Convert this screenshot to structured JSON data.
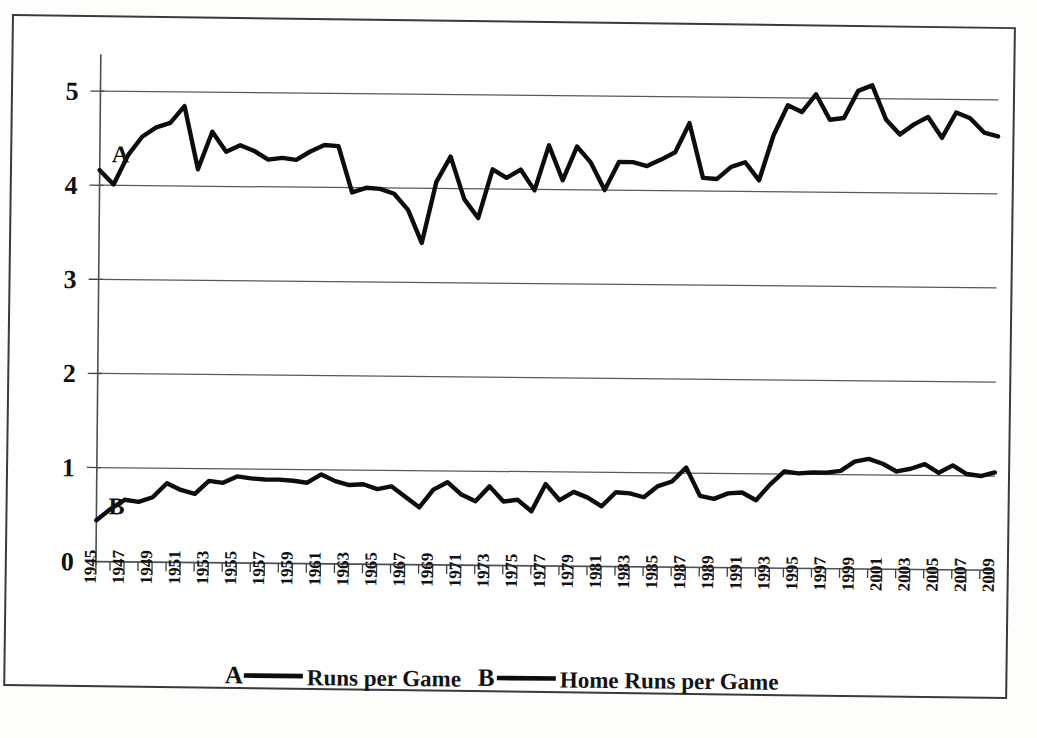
{
  "figure": {
    "name": "baseball-offense-chart",
    "border_color": "#3a3a3a",
    "background": "#ffffff"
  },
  "axes": {
    "y_ticks": [
      "0",
      "1",
      "2",
      "3",
      "4",
      "5"
    ],
    "y_min": 0,
    "y_max": 5.45,
    "x_min": 1945,
    "x_max": 2009,
    "x_tick_labels": [
      "1945",
      "1947",
      "1949",
      "1951",
      "1953",
      "1955",
      "1957",
      "1959",
      "1961",
      "1963",
      "1965",
      "1967",
      "1969",
      "1971",
      "1973",
      "1975",
      "1977",
      "1979",
      "1981",
      "1983",
      "1985",
      "1987",
      "1989",
      "1991",
      "1993",
      "1995",
      "1997",
      "1999",
      "2001",
      "2003",
      "2005",
      "2007",
      "2009"
    ],
    "grid": "horizontal"
  },
  "series_tags": {
    "a": "A",
    "b": "B"
  },
  "legend": {
    "position": "bottom-center",
    "items": [
      {
        "tag": "A",
        "label": "Runs per Game"
      },
      {
        "tag": "B",
        "label": "Home Runs per Game"
      }
    ]
  },
  "colors": {
    "line": "#0d0d0d",
    "grid": "#555a5e",
    "axis": "#4a4f53",
    "text": "#111111"
  },
  "chart_data": {
    "type": "line",
    "title": "",
    "xlabel": "",
    "ylabel": "",
    "xlim": [
      1945,
      2009
    ],
    "ylim": [
      0,
      5.45
    ],
    "grid": true,
    "legend_position": "bottom-center",
    "x": [
      1945,
      1946,
      1947,
      1948,
      1949,
      1950,
      1951,
      1952,
      1953,
      1954,
      1955,
      1956,
      1957,
      1958,
      1959,
      1960,
      1961,
      1962,
      1963,
      1964,
      1965,
      1966,
      1967,
      1968,
      1969,
      1970,
      1971,
      1972,
      1973,
      1974,
      1975,
      1976,
      1977,
      1978,
      1979,
      1980,
      1981,
      1982,
      1983,
      1984,
      1985,
      1986,
      1987,
      1988,
      1989,
      1990,
      1991,
      1992,
      1993,
      1994,
      1995,
      1996,
      1997,
      1998,
      1999,
      2000,
      2001,
      2002,
      2003,
      2004,
      2005,
      2006,
      2007,
      2008,
      2009
    ],
    "series": [
      {
        "name": "Runs per Game",
        "tag": "A",
        "values": [
          4.16,
          4.01,
          4.32,
          4.52,
          4.62,
          4.67,
          4.85,
          4.18,
          4.58,
          4.37,
          4.44,
          4.38,
          4.29,
          4.31,
          4.29,
          4.38,
          4.45,
          4.44,
          3.95,
          4.0,
          3.99,
          3.94,
          3.77,
          3.42,
          4.07,
          4.34,
          3.89,
          3.69,
          4.21,
          4.12,
          4.21,
          3.99,
          4.47,
          4.1,
          4.46,
          4.29,
          4.0,
          4.3,
          4.3,
          4.26,
          4.33,
          4.41,
          4.72,
          4.14,
          4.13,
          4.26,
          4.31,
          4.12,
          4.6,
          4.92,
          4.85,
          5.04,
          4.77,
          4.79,
          5.08,
          5.14,
          4.78,
          4.62,
          4.73,
          4.81,
          4.59,
          4.86,
          4.8,
          4.65,
          4.61
        ]
      },
      {
        "name": "Home Runs per Game",
        "tag": "B",
        "values": [
          0.44,
          0.56,
          0.66,
          0.64,
          0.69,
          0.84,
          0.77,
          0.73,
          0.87,
          0.85,
          0.92,
          0.9,
          0.89,
          0.89,
          0.88,
          0.86,
          0.95,
          0.88,
          0.84,
          0.85,
          0.8,
          0.83,
          0.72,
          0.61,
          0.8,
          0.88,
          0.75,
          0.68,
          0.84,
          0.68,
          0.7,
          0.58,
          0.87,
          0.7,
          0.79,
          0.73,
          0.64,
          0.79,
          0.78,
          0.74,
          0.86,
          0.91,
          1.06,
          0.76,
          0.73,
          0.79,
          0.8,
          0.72,
          0.89,
          1.03,
          1.01,
          1.02,
          1.02,
          1.04,
          1.14,
          1.17,
          1.12,
          1.04,
          1.07,
          1.12,
          1.03,
          1.11,
          1.02,
          1.0,
          1.04
        ]
      }
    ]
  }
}
